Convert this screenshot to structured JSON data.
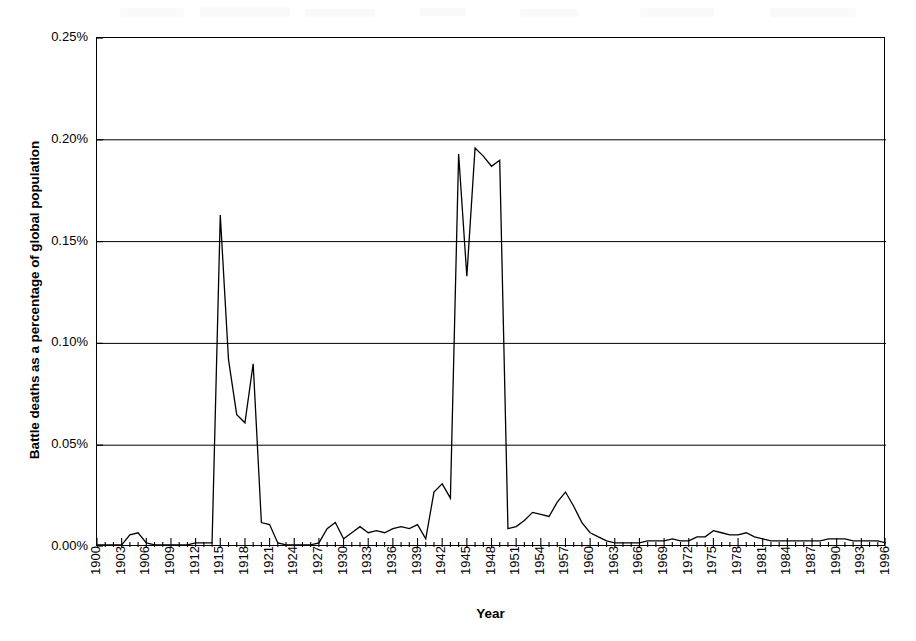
{
  "chart_data": {
    "type": "line",
    "title": "",
    "xlabel": "Year",
    "ylabel": "Battle deaths as a percentage of global population",
    "xlim": [
      1900,
      1996
    ],
    "ylim": [
      0,
      0.25
    ],
    "grid": "horizontal",
    "legend": "none",
    "y_ticks": [
      "0.00%",
      "0.05%",
      "0.10%",
      "0.15%",
      "0.20%",
      "0.25%"
    ],
    "y_tick_values": [
      0.0,
      0.05,
      0.1,
      0.15,
      0.2,
      0.25
    ],
    "x_tick_labels": [
      "1900",
      "1903",
      "1906",
      "1909",
      "1912",
      "1915",
      "1918",
      "1921",
      "1924",
      "1927",
      "1930",
      "1933",
      "1936",
      "1939",
      "1942",
      "1945",
      "1948",
      "1951",
      "1954",
      "1957",
      "1960",
      "1963",
      "1966",
      "1969",
      "1972",
      "1975",
      "1978",
      "1981",
      "1984",
      "1987",
      "1990",
      "1993",
      "1996"
    ],
    "x_tick_step": 3,
    "x_minor_tick_step": 1,
    "series": [
      {
        "name": "Battle deaths as a percentage of global population",
        "color": "#000000",
        "x": [
          1900,
          1901,
          1902,
          1903,
          1904,
          1905,
          1906,
          1907,
          1908,
          1909,
          1910,
          1911,
          1912,
          1913,
          1914,
          1915,
          1916,
          1917,
          1918,
          1919,
          1920,
          1921,
          1922,
          1923,
          1924,
          1925,
          1926,
          1927,
          1928,
          1929,
          1930,
          1931,
          1932,
          1933,
          1934,
          1935,
          1936,
          1937,
          1938,
          1939,
          1940,
          1941,
          1942,
          1943,
          1944,
          1945,
          1946,
          1947,
          1948,
          1949,
          1950,
          1951,
          1952,
          1953,
          1954,
          1955,
          1956,
          1957,
          1958,
          1959,
          1960,
          1961,
          1962,
          1963,
          1964,
          1965,
          1966,
          1967,
          1968,
          1969,
          1970,
          1971,
          1972,
          1973,
          1974,
          1975,
          1976,
          1977,
          1978,
          1979,
          1980,
          1981,
          1982,
          1983,
          1984,
          1985,
          1986,
          1987,
          1988,
          1989,
          1990,
          1991,
          1992,
          1993,
          1994,
          1995,
          1996
        ],
        "y": [
          0.001,
          0.001,
          0.001,
          0.001,
          0.006,
          0.007,
          0.002,
          0.001,
          0.001,
          0.001,
          0.001,
          0.001,
          0.002,
          0.002,
          0.002,
          0.163,
          0.092,
          0.065,
          0.061,
          0.09,
          0.012,
          0.011,
          0.002,
          0.001,
          0.001,
          0.001,
          0.001,
          0.002,
          0.009,
          0.012,
          0.004,
          0.007,
          0.01,
          0.007,
          0.008,
          0.007,
          0.009,
          0.01,
          0.009,
          0.011,
          0.004,
          0.027,
          0.031,
          0.024,
          0.193,
          0.133,
          0.196,
          0.192,
          0.187,
          0.19,
          0.009,
          0.01,
          0.013,
          0.017,
          0.016,
          0.015,
          0.022,
          0.027,
          0.02,
          0.012,
          0.007,
          0.005,
          0.003,
          0.002,
          0.002,
          0.002,
          0.002,
          0.003,
          0.003,
          0.003,
          0.004,
          0.003,
          0.003,
          0.005,
          0.005,
          0.008,
          0.007,
          0.006,
          0.006,
          0.007,
          0.005,
          0.004,
          0.003,
          0.003,
          0.003,
          0.003,
          0.003,
          0.003,
          0.003,
          0.004,
          0.004,
          0.004,
          0.003,
          0.003,
          0.003,
          0.003,
          0.002
        ]
      }
    ],
    "annotations": [
      {
        "label": "World War I peak",
        "year": 1915,
        "value": 0.163
      },
      {
        "label": "World War I secondary peak",
        "year": 1919,
        "value": 0.09
      },
      {
        "label": "World War II first peak",
        "year": 1944,
        "value": 0.193
      },
      {
        "label": "World War II dip",
        "year": 1945,
        "value": 0.133
      },
      {
        "label": "World War II second peak",
        "year": 1946,
        "value": 0.196
      },
      {
        "label": "Korean War peak",
        "year": 1957,
        "value": 0.027
      }
    ]
  },
  "axis": {
    "y_title": "Battle deaths as a percentage of global population",
    "x_title": "Year"
  }
}
